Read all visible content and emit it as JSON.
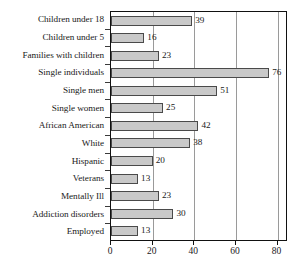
{
  "chart_data": {
    "type": "bar",
    "orientation": "horizontal",
    "title": "",
    "subtitle": "",
    "xlabel": "",
    "ylabel": "",
    "xlim": [
      0,
      85
    ],
    "axis_max_tick": 80,
    "grid": true,
    "grid_axis": "x",
    "legend": null,
    "legend_position": "none",
    "data_labels": true,
    "categories": [
      "Children under 18",
      "Children under 5",
      "Families with children",
      "Single individuals",
      "Single men",
      "Single women",
      "African American",
      "White",
      "Hispanic",
      "Veterans",
      "Mentally Ill",
      "Addiction disorders",
      "Employed"
    ],
    "values": [
      39,
      16,
      23,
      76,
      51,
      25,
      42,
      38,
      20,
      13,
      23,
      30,
      13
    ],
    "value_labels": [
      "39",
      "16",
      "23",
      "76",
      "51",
      "25",
      "42",
      "38",
      "20",
      "13",
      "23",
      "30",
      "13"
    ],
    "xticks": [
      0,
      20,
      40,
      60,
      80
    ],
    "xtick_labels": [
      "0",
      "20",
      "40",
      "60",
      "80"
    ],
    "colors": {
      "bar_fill": "#c9c9c9",
      "bar_border": "#4a4a4a",
      "axis": "#111111",
      "gridline": "#9a9a9a",
      "text": "#1a1a1a",
      "background": "#ffffff"
    }
  }
}
